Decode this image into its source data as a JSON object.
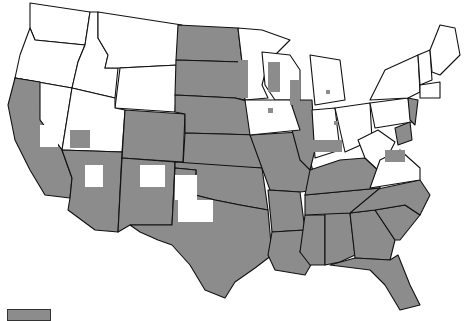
{
  "map": {
    "type": "choropleth",
    "region": "Contiguous United States",
    "colors": {
      "shaded": "#8c8c8c",
      "unshaded": "#ffffff",
      "border": "#111111"
    },
    "shaded_states_full": [
      "ND",
      "SD",
      "NE",
      "KS",
      "OK",
      "TX",
      "MO",
      "AR",
      "LA",
      "MS",
      "AL",
      "GA",
      "FL",
      "SC",
      "NC",
      "TN",
      "KY",
      "IL",
      "DE",
      "NJ"
    ],
    "shaded_states_partial": [
      "CA",
      "AZ",
      "NM",
      "CO",
      "UT",
      "NV",
      "WY",
      "MN",
      "WI",
      "IA",
      "IN",
      "OH",
      "MI",
      "VA",
      "MD",
      "PA",
      "NY"
    ],
    "unshaded_states": [
      "WA",
      "OR",
      "ID",
      "MT",
      "WV",
      "CT",
      "RI",
      "MA",
      "VT",
      "NH",
      "ME"
    ]
  },
  "legend": {
    "items": [
      {
        "label": "",
        "color": "#8c8c8c"
      }
    ]
  }
}
